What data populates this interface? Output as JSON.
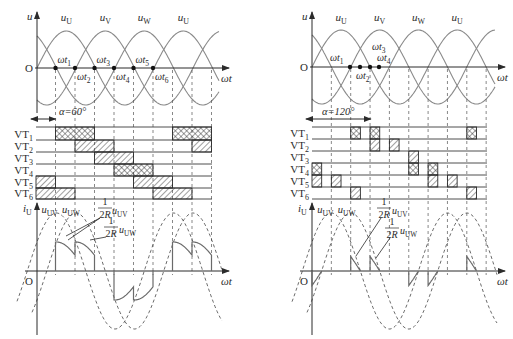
{
  "colors": {
    "ink": "#2b2b2b",
    "wave": "#8a8a8a",
    "current": "#6a6a6a",
    "background": "#ffffff"
  },
  "panels": [
    {
      "id": "left",
      "alpha_label": "α=60°",
      "alpha_deg": 60,
      "voltage_plot": {
        "y_axis_label": "u",
        "x_axis_label": "ωt",
        "origin_label": "O",
        "wave_labels": [
          "u_U",
          "u_V",
          "u_W",
          "u_U"
        ],
        "points": [
          {
            "label": "ωt",
            "sub": "1",
            "pos": "above"
          },
          {
            "label": "ωt",
            "sub": "2",
            "pos": "below"
          },
          {
            "label": "ωt",
            "sub": "3",
            "pos": "above"
          },
          {
            "label": "ωt",
            "sub": "4",
            "pos": "below"
          },
          {
            "label": "ωt",
            "sub": "5",
            "pos": "above"
          },
          {
            "label": "ωt",
            "sub": "6",
            "pos": "below"
          }
        ]
      },
      "thyristors": [
        "VT1",
        "VT2",
        "VT3",
        "VT4",
        "VT5",
        "VT6"
      ],
      "conduction": {
        "VT1": [
          [
            1,
            3,
            "cross"
          ],
          [
            7,
            9,
            "cross"
          ]
        ],
        "VT2": [
          [
            2,
            4,
            "hatch"
          ],
          [
            8,
            9,
            "hatch"
          ]
        ],
        "VT3": [
          [
            3,
            5,
            "hatch"
          ]
        ],
        "VT4": [
          [
            4,
            6,
            "cross"
          ]
        ],
        "VT5": [
          [
            0,
            1,
            "hatch"
          ],
          [
            5,
            7,
            "hatch"
          ]
        ],
        "VT6": [
          [
            0,
            2,
            "hatch"
          ],
          [
            6,
            8,
            "hatch"
          ]
        ]
      },
      "current_plot": {
        "y_axis_label": "i_U",
        "x_axis_label": "ωt",
        "origin_label": "O",
        "dashed_labels": [
          "u_UV",
          "u_UW"
        ],
        "annotations": [
          {
            "numerator": "1",
            "denominator": "2R",
            "signal": "u_UV"
          },
          {
            "numerator": "1",
            "denominator": "2R",
            "signal": "u_UW"
          }
        ]
      }
    },
    {
      "id": "right",
      "alpha_label": "α=120°",
      "alpha_deg": 120,
      "voltage_plot": {
        "y_axis_label": "u",
        "x_axis_label": "ωt",
        "origin_label": "O",
        "wave_labels": [
          "u_U",
          "u_V",
          "u_W",
          "u_U"
        ],
        "points": [
          {
            "label": "ωt",
            "sub": "1",
            "pos": "above"
          },
          {
            "label": "ωt",
            "sub": "2",
            "pos": "below"
          },
          {
            "label": "ωt",
            "sub": "3",
            "pos": "above"
          },
          {
            "label": "ωt",
            "sub": "4",
            "pos": "above"
          }
        ]
      },
      "thyristors": [
        "VT1",
        "VT2",
        "VT3",
        "VT4",
        "VT5",
        "VT6"
      ],
      "conduction": {
        "VT1": [
          [
            2,
            2.5,
            "cross"
          ],
          [
            3,
            3.5,
            "cross"
          ],
          [
            8,
            8.5,
            "cross"
          ]
        ],
        "VT2": [
          [
            3,
            3.5,
            "hatch"
          ],
          [
            4,
            4.5,
            "hatch"
          ]
        ],
        "VT3": [
          [
            5,
            5.5,
            "hatch"
          ]
        ],
        "VT4": [
          [
            0,
            0.5,
            "cross"
          ],
          [
            5,
            5.5,
            "cross"
          ],
          [
            6,
            6.5,
            "cross"
          ]
        ],
        "VT5": [
          [
            0,
            0.5,
            "hatch"
          ],
          [
            1,
            1.5,
            "hatch"
          ],
          [
            6,
            6.5,
            "hatch"
          ],
          [
            7,
            7.5,
            "hatch"
          ]
        ],
        "VT6": [
          [
            2,
            2.5,
            "hatch"
          ],
          [
            8,
            8.5,
            "hatch"
          ]
        ]
      },
      "current_plot": {
        "y_axis_label": "i_U",
        "x_axis_label": "ωt",
        "origin_label": "O",
        "dashed_labels": [
          "u_UV",
          "u_UW"
        ],
        "annotations": [
          {
            "numerator": "1",
            "denominator": "2R",
            "signal": "u_UV"
          },
          {
            "numerator": "1",
            "denominator": "2R",
            "signal": "u_UW"
          }
        ]
      }
    }
  ]
}
